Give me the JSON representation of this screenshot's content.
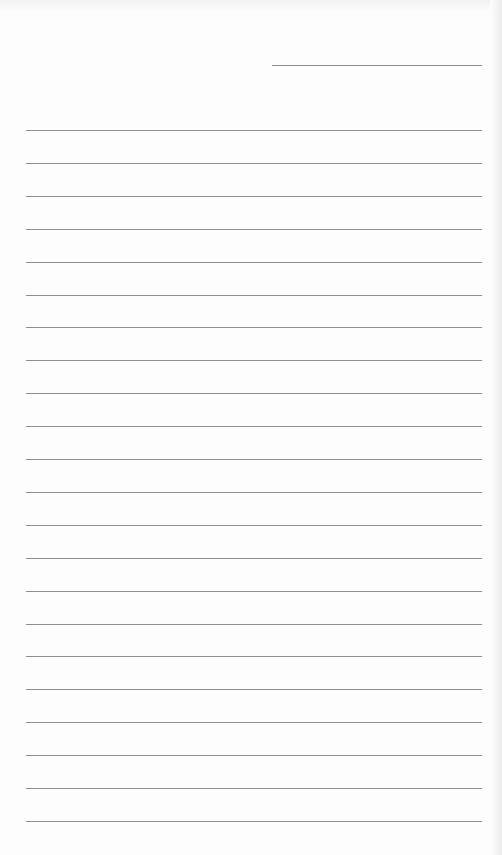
{
  "page": {
    "type": "lined-notebook-page",
    "background": "#fdfdfd",
    "line_color": "#8e8e8e",
    "date_line": {
      "present": true,
      "text": ""
    },
    "ruled_line_count": 22,
    "lines": [
      "",
      "",
      "",
      "",
      "",
      "",
      "",
      "",
      "",
      "",
      "",
      "",
      "",
      "",
      "",
      "",
      "",
      "",
      "",
      "",
      "",
      ""
    ]
  }
}
